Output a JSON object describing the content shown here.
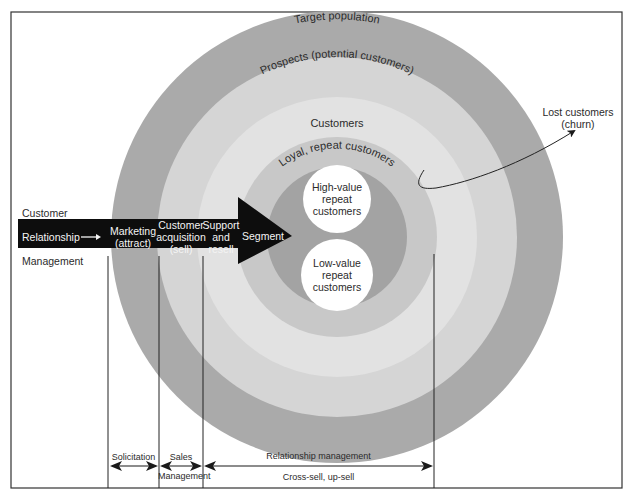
{
  "diagram": {
    "rings": [
      {
        "label": "Target population",
        "color": "#a9a9a9"
      },
      {
        "label": "Prospects (potential customers)",
        "color": "#d6d6d6"
      },
      {
        "label": "Customers",
        "color": "#e3e3e3"
      },
      {
        "label": "Loyal, repeat customers",
        "color": "#c9c9c9"
      },
      {
        "label": "",
        "color": "#a6a6a6"
      }
    ],
    "segments": [
      {
        "line1": "High-value",
        "line2": "repeat",
        "line3": "customers"
      },
      {
        "line1": "Low-value",
        "line2": "repeat",
        "line3": "customers"
      }
    ],
    "churn": {
      "line1": "Lost customers",
      "line2": "(churn)"
    },
    "arrow": {
      "left_top": "Customer",
      "left_middle": "Relationship",
      "left_bottom": "Management",
      "arrow_glyph": "→",
      "stages": [
        {
          "line1": "Marketing",
          "line2": "(attract)"
        },
        {
          "line1": "Customer",
          "line2": "acquisition",
          "line3": "(sell)"
        },
        {
          "line1": "Support",
          "line2": "and",
          "line3": "resell"
        },
        {
          "line1": "Segment"
        }
      ],
      "fill": "#0d0d0d"
    },
    "bottom": {
      "solicitation": "Solicitation",
      "sales": "Sales",
      "sales_management": "Management",
      "relationship_management": "Relationship management",
      "cross_sell": "Cross-sell, up-sell"
    }
  }
}
